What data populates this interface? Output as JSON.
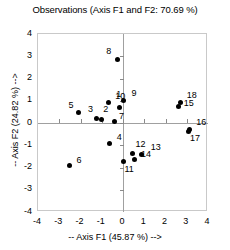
{
  "chart_data": {
    "type": "scatter",
    "title": "Observations (Axis F1 and F2: 70.69 %)",
    "xlabel": "-- Axis F1 (45.87 %) -->",
    "ylabel": "-- Axis F2 (24.82 %) -->",
    "xlim": [
      -4,
      4
    ],
    "ylim": [
      -4,
      4
    ],
    "xticks": [
      -4,
      -3,
      -2,
      -1,
      0,
      1,
      2,
      3,
      4
    ],
    "yticks": [
      -4,
      -3,
      -2,
      -1,
      0,
      1,
      2,
      3,
      4
    ],
    "xtick_labels": [
      "-4",
      "-3",
      "-2",
      "-1",
      "0",
      "1",
      "2",
      "3",
      "4"
    ],
    "ytick_labels": [
      "-4",
      "-3",
      "-2",
      "-1",
      "0",
      "1",
      "2",
      "3",
      "4"
    ],
    "grid": false,
    "legend": "none",
    "marker_color": "#000000",
    "axis_color": "#a0a0a0",
    "points": [
      {
        "label": "1",
        "x": -0.7,
        "y": 0.93,
        "lx": 8,
        "ly": -12
      },
      {
        "label": "2",
        "x": -1.02,
        "y": 0.14,
        "lx": 2,
        "ly": -15
      },
      {
        "label": "3",
        "x": -1.27,
        "y": 0.18,
        "lx": -8,
        "ly": -14
      },
      {
        "label": "4",
        "x": -0.62,
        "y": -0.93,
        "lx": 7,
        "ly": -11
      },
      {
        "label": "5",
        "x": -2.1,
        "y": 0.47,
        "lx": -10,
        "ly": -12
      },
      {
        "label": "6",
        "x": -2.52,
        "y": -1.92,
        "lx": 7,
        "ly": -10
      },
      {
        "label": "7",
        "x": -0.42,
        "y": 0.08,
        "lx": 5,
        "ly": -9
      },
      {
        "label": "8",
        "x": -0.27,
        "y": 2.86,
        "lx": -11,
        "ly": -12
      },
      {
        "label": "9",
        "x": 0.02,
        "y": 1.03,
        "lx": 8,
        "ly": -11
      },
      {
        "label": "10",
        "x": -0.18,
        "y": 0.7,
        "lx": -4,
        "ly": -15
      },
      {
        "label": "11",
        "x": 0.02,
        "y": -1.74,
        "lx": 1,
        "ly": 3
      },
      {
        "label": "12",
        "x": 0.45,
        "y": -1.36,
        "lx": 3,
        "ly": -13
      },
      {
        "label": "13",
        "x": 0.88,
        "y": -1.4,
        "lx": 9,
        "ly": -11
      },
      {
        "label": "14",
        "x": 0.52,
        "y": -1.63,
        "lx": 7,
        "ly": -9
      },
      {
        "label": "15",
        "x": 2.62,
        "y": 0.72,
        "lx": 5,
        "ly": -8
      },
      {
        "label": "16",
        "x": 3.12,
        "y": -0.28,
        "lx": 7,
        "ly": -11
      },
      {
        "label": "17",
        "x": 3.1,
        "y": -0.38,
        "lx": 1,
        "ly": 3
      },
      {
        "label": "18",
        "x": 2.72,
        "y": 0.92,
        "lx": 6,
        "ly": -12
      }
    ]
  }
}
